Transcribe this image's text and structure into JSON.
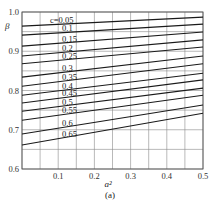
{
  "chart_data": {
    "type": "line",
    "title": "",
    "caption": "(a)",
    "xlabel": "a²",
    "ylabel": "β",
    "xlim": [
      0,
      0.5
    ],
    "ylim": [
      0.6,
      1.0
    ],
    "xticks": [
      0.1,
      0.2,
      0.3,
      0.4,
      0.5
    ],
    "xtick_labels": [
      "0.1",
      "0.2",
      "0.3",
      "0.4",
      "0.5"
    ],
    "yticks": [
      0.6,
      0.7,
      0.8,
      0.9,
      1.0
    ],
    "ytick_labels": [
      "0.6",
      "0.7",
      "0.8",
      "0.9",
      "1.0"
    ],
    "grid": true,
    "grid_x_step": 0.05,
    "grid_y_step": 0.05,
    "legend": "inline labels along lines (parameter c)",
    "x": [
      0,
      0.5
    ],
    "series": [
      {
        "name": "c=0.05",
        "label": "c=0.05",
        "values": [
          0.964,
          0.987
        ]
      },
      {
        "name": "c=0.1",
        "label": "0.1",
        "values": [
          0.941,
          0.969
        ]
      },
      {
        "name": "c=0.15",
        "label": "0.15",
        "values": [
          0.913,
          0.949
        ]
      },
      {
        "name": "c=0.2",
        "label": "0.2",
        "values": [
          0.888,
          0.929
        ]
      },
      {
        "name": "c=0.25",
        "label": "0.25",
        "values": [
          0.868,
          0.911
        ]
      },
      {
        "name": "c=0.3",
        "label": "0.3",
        "values": [
          0.834,
          0.888
        ]
      },
      {
        "name": "c=0.35",
        "label": "0.35",
        "values": [
          0.811,
          0.868
        ]
      },
      {
        "name": "c=0.4",
        "label": "0.4",
        "values": [
          0.788,
          0.844
        ]
      },
      {
        "name": "c=0.45",
        "label": "0.45",
        "values": [
          0.768,
          0.827
        ]
      },
      {
        "name": "c=0.5",
        "label": "0.5",
        "values": [
          0.747,
          0.806
        ]
      },
      {
        "name": "c=0.55",
        "label": "0.55",
        "values": [
          0.724,
          0.788
        ]
      },
      {
        "name": "c=0.6",
        "label": "0.6",
        "values": [
          0.689,
          0.763
        ]
      },
      {
        "name": "c=0.65",
        "label": "0.65",
        "values": [
          0.661,
          0.742
        ]
      }
    ]
  },
  "style": {
    "line_color": "#1a1a1a",
    "grid_color": "#8a8a8a",
    "frame_color": "#555555"
  }
}
